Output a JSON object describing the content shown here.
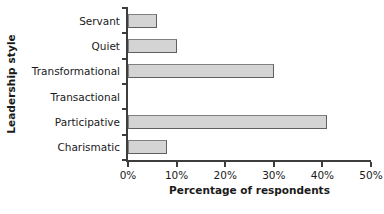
{
  "chart_data": {
    "type": "bar",
    "orientation": "horizontal",
    "title": "",
    "xlabel": "Percentage of respondents",
    "ylabel": "Leadership style",
    "categories": [
      "Servant",
      "Quiet",
      "Transformational",
      "Transactional",
      "Participative",
      "Charismatic"
    ],
    "values": [
      6,
      10,
      30,
      0,
      41,
      8
    ],
    "xlim": [
      0,
      50
    ],
    "xtick_values": [
      0,
      10,
      20,
      30,
      40,
      50
    ],
    "xtick_labels": [
      "0%",
      "10%",
      "20%",
      "30%",
      "40%",
      "50%"
    ],
    "grid": false,
    "legend": null,
    "bar_fill_color": "#d4d4d4",
    "bar_border_color": "#808080",
    "axis_color": "#3d3d3d"
  }
}
